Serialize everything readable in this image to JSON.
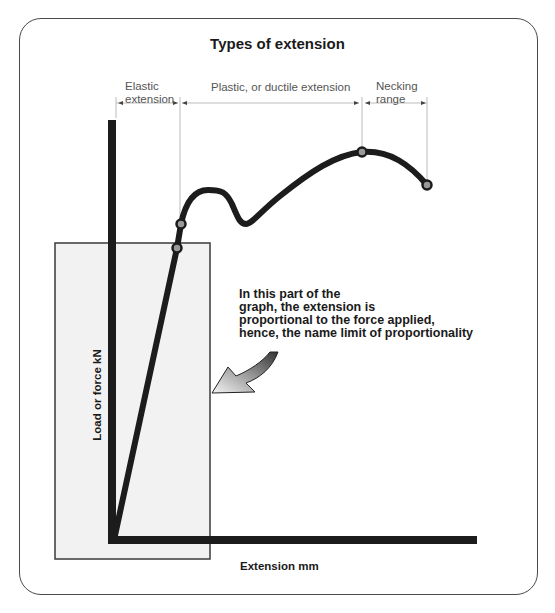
{
  "title": "Types of extension",
  "ranges": [
    {
      "label_line1": "Elastic",
      "label_line2": "extension"
    },
    {
      "label_line1": "Plastic, or ductile extension",
      "label_line2": ""
    },
    {
      "label_line1": "Necking",
      "label_line2": "range"
    }
  ],
  "annotation": {
    "lines": [
      "In this part of the",
      "graph, the extension is",
      "proportional to the force applied,",
      "hence, the name limit of proportionality"
    ]
  },
  "axes": {
    "y_label": "Load or force kN",
    "x_label": "Extension mm"
  },
  "colors": {
    "curve": "#1c1c1c",
    "highlight_box_fill": "#f2f2f2",
    "point_fill": "#9a9a9a",
    "dimension_line": "#bbbbbb"
  },
  "key_points": [
    {
      "name": "limit-of-proportionality"
    },
    {
      "name": "elastic-limit"
    },
    {
      "name": "maximum-load"
    },
    {
      "name": "breaking-point"
    }
  ]
}
